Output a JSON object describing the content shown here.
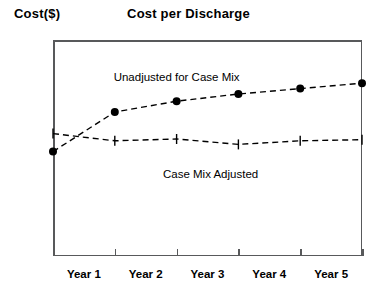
{
  "chart_data": {
    "type": "line",
    "title": "Cost per Discharge",
    "ylabel": "Cost($)",
    "xlabel": "",
    "categories": [
      "Year 0",
      "Year 1",
      "Year 2",
      "Year 3",
      "Year 4",
      "Year 5"
    ],
    "xtick_labels": [
      "Year 1",
      "Year 2",
      "Year 3",
      "Year 4",
      "Year 5"
    ],
    "ytick_labels": [
      "6,000",
      "5,000",
      "4,000",
      "3,000",
      "2,000",
      "1,000",
      "0"
    ],
    "ylim": [
      0,
      6000
    ],
    "ytick_values": [
      6000,
      5000,
      4000,
      3000,
      2000,
      1000,
      0
    ],
    "grid": false,
    "legend": "annotations-inline",
    "series": [
      {
        "name": "Unadjusted for Case Mix",
        "marker": "filled-circle",
        "linestyle": "dashed",
        "color": "#000000",
        "values": [
          2900,
          4000,
          4300,
          4500,
          4650,
          4800
        ]
      },
      {
        "name": "Case Mix Adjusted",
        "marker": "vertical-tick",
        "linestyle": "dashed",
        "color": "#000000",
        "values": [
          3400,
          3200,
          3250,
          3100,
          3200,
          3230
        ]
      }
    ],
    "annotations": [
      {
        "text": "Unadjusted for Case Mix",
        "x_value": 2.0,
        "y_value": 5150
      },
      {
        "text": "Case Mix Adjusted",
        "x_value": 2.55,
        "y_value": 2450
      }
    ]
  }
}
